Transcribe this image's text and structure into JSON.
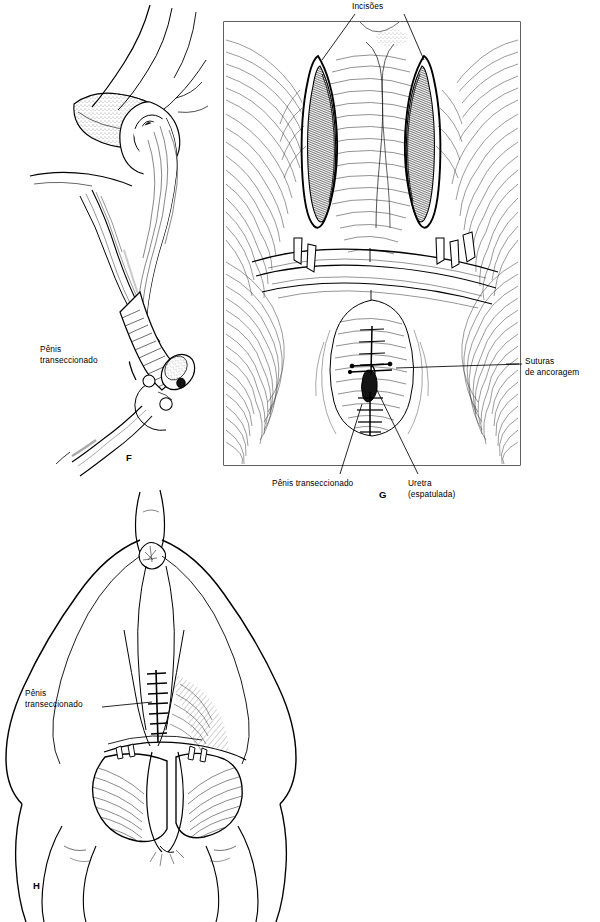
{
  "figure": {
    "type": "surgical-illustration",
    "language": "pt-BR",
    "background_color": "#ffffff",
    "ink_color": "#000000",
    "panels": [
      {
        "id": "F",
        "label": "F",
        "caption": "Vista lateral da pelve com o pênis transeccionado",
        "labels": [
          {
            "name": "penis-transeccionado",
            "text": "Pênis\ntranseccionado",
            "line1": "Pênis",
            "line2": "transeccionado"
          }
        ]
      },
      {
        "id": "G",
        "label": "G",
        "caption": "Vista perineal com incisões e suturas de ancoragem",
        "framed": true,
        "labels": [
          {
            "name": "incisoes",
            "text": "Incisões"
          },
          {
            "name": "suturas-de-ancoragem",
            "line1": "Suturas",
            "line2": "de ancoragem"
          },
          {
            "name": "penis-transeccionado",
            "text": "Pênis transeccionado"
          },
          {
            "name": "uretra-espatulada",
            "line1": "Uretra",
            "line2": "(espatulada)"
          }
        ]
      },
      {
        "id": "H",
        "label": "H",
        "caption": "Vista caudal do períneo e escroto",
        "labels": [
          {
            "name": "penis-transeccionado",
            "line1": "Pênis",
            "line2": "transeccionado"
          }
        ]
      }
    ]
  },
  "labels": {
    "incisoes": "Incisões",
    "penis_line1": "Pênis",
    "penis_line2": "transeccionado",
    "penis_inline": "Pênis transeccionado",
    "suturas_line1": "Suturas",
    "suturas_line2": "de ancoragem",
    "uretra_line1": "Uretra",
    "uretra_line2": "(espatulada)"
  },
  "panel_letters": {
    "F": "F",
    "G": "G",
    "H": "H"
  }
}
